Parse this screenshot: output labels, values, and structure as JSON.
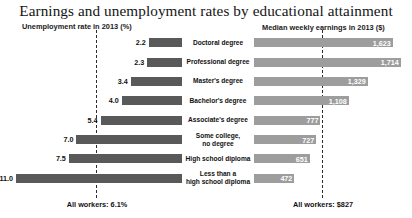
{
  "chart_data": {
    "type": "bar",
    "title": "Earnings and unemployment rates by educational attainment",
    "orientation": "horizontal",
    "layout": "diverging-paired-panels",
    "grid": false,
    "legend": "none",
    "categories": [
      "Doctoral degree",
      "Professional degree",
      "Master's degree",
      "Bachelor's degree",
      "Associate's degree",
      "Some college,\nno degree",
      "High school diploma",
      "Less than a\nhigh school diploma"
    ],
    "series": [
      {
        "name": "Unemployment rate in 2013 (%)",
        "panel": "left",
        "direction": "right-to-left",
        "unit": "%",
        "color": "#595959",
        "values": [
          2.2,
          2.3,
          3.4,
          4.0,
          5.4,
          7.0,
          7.5,
          11.0
        ],
        "value_labels": [
          "2.2",
          "2.3",
          "3.4",
          "4.0",
          "5.4",
          "7.0",
          "7.5",
          "11.0"
        ],
        "xlim": [
          0,
          11.8
        ],
        "reference_line": {
          "value": 6.1,
          "label": "All workers: 6.1%"
        }
      },
      {
        "name": "Median weekly earnings in 2013 ($)",
        "panel": "right",
        "direction": "left-to-right",
        "unit": "$",
        "color": "#9d9d9d",
        "values": [
          1623,
          1714,
          1329,
          1108,
          777,
          727,
          651,
          472
        ],
        "value_labels": [
          "1,623",
          "1,714",
          "1,329",
          "1,108",
          "777",
          "727",
          "651",
          "472"
        ],
        "xlim": [
          0,
          1800
        ],
        "reference_line": {
          "value": 827,
          "label": "All workers: $827"
        }
      }
    ]
  },
  "headers": {
    "left": "Unemployment rate in 2013 (%)",
    "right": "Median weekly earnings in 2013 ($)"
  },
  "footnotes": {
    "left": "All workers: 6.1%",
    "right": "All workers: $827"
  },
  "colors": {
    "unemployment_bar": "#595959",
    "earnings_bar": "#9d9d9d",
    "reference_line": "#2b2b2b",
    "text": "#111111",
    "background": "#ffffff"
  }
}
